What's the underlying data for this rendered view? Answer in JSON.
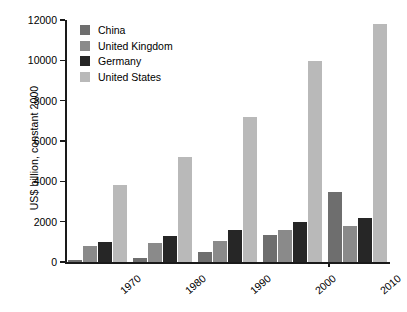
{
  "chart_data": {
    "type": "bar",
    "title": "",
    "xlabel": "",
    "ylabel": "US$ billion, constant 2000",
    "ylim": [
      0,
      12000
    ],
    "ytick_values": [
      0,
      2000,
      4000,
      6000,
      8000,
      10000,
      12000
    ],
    "ytick_labels": [
      "0",
      "2000",
      "4000",
      "6000",
      "8000",
      "10000",
      "12000"
    ],
    "grid": false,
    "legend_position": "upper left",
    "categories": [
      "1970",
      "1980",
      "1990",
      "2000",
      "2010"
    ],
    "series": [
      {
        "name": "China",
        "color": "#6e6e6e",
        "values": [
          120,
          210,
          520,
          1350,
          3450
        ]
      },
      {
        "name": "United Kingdom",
        "color": "#8a8a8a",
        "values": [
          800,
          950,
          1060,
          1600,
          1800
        ]
      },
      {
        "name": "Germany",
        "color": "#262626",
        "values": [
          1000,
          1300,
          1600,
          2000,
          2200
        ]
      },
      {
        "name": "United States",
        "color": "#b9b9b9",
        "values": [
          3800,
          5200,
          7200,
          9950,
          11800
        ]
      }
    ]
  },
  "legend": {
    "items": [
      {
        "label": "China"
      },
      {
        "label": "United Kingdom"
      },
      {
        "label": "Germany"
      },
      {
        "label": "United States"
      }
    ]
  }
}
